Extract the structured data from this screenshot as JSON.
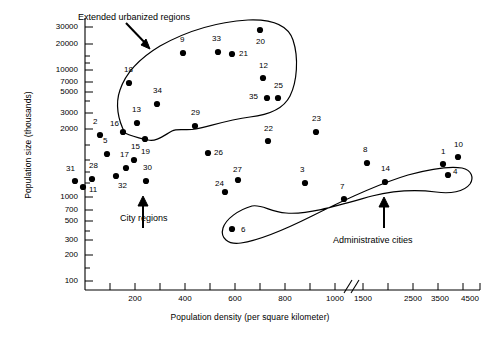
{
  "chart_data": {
    "type": "scatter",
    "title": "",
    "xlabel": "Population density (per square kilometer)",
    "ylabel": "Population size (thousands)",
    "yscale": "log",
    "grid": false,
    "legend": "none",
    "axis_break": "//",
    "xticks": [
      {
        "label": "",
        "value": 0,
        "px": 85
      },
      {
        "label": "",
        "value": 100,
        "px": 110
      },
      {
        "label": "200",
        "value": 200,
        "px": 135
      },
      {
        "label": "",
        "value": 300,
        "px": 160
      },
      {
        "label": "400",
        "value": 400,
        "px": 185
      },
      {
        "label": "",
        "value": 500,
        "px": 210
      },
      {
        "label": "600",
        "value": 600,
        "px": 235
      },
      {
        "label": "",
        "value": 700,
        "px": 260
      },
      {
        "label": "800",
        "value": 800,
        "px": 285
      },
      {
        "label": "",
        "value": 900,
        "px": 310
      },
      {
        "label": "1000",
        "value": 1000,
        "px": 335
      },
      {
        "label": "1500",
        "value": 1500,
        "px": 363
      },
      {
        "label": "",
        "value": 2000,
        "px": 388
      },
      {
        "label": "2500",
        "value": 2500,
        "px": 413
      },
      {
        "label": "",
        "value": 3000,
        "px": 438
      },
      {
        "label": "3500",
        "value": 3500,
        "px": 440
      },
      {
        "label": "",
        "value": 4000,
        "px": 443
      },
      {
        "label": "4500",
        "value": 4500,
        "px": 470
      }
    ],
    "yticks": [
      {
        "label": "30000",
        "value": 30000,
        "px": 27
      },
      {
        "label": "20000",
        "value": 20000,
        "px": 44
      },
      {
        "label": "10000",
        "value": 10000,
        "px": 70
      },
      {
        "label": "7000",
        "value": 7000,
        "px": 82
      },
      {
        "label": "5000",
        "value": 5000,
        "px": 92
      },
      {
        "label": "3000",
        "value": 3000,
        "px": 113
      },
      {
        "label": "2000",
        "value": 2000,
        "px": 129
      },
      {
        "label": "1000",
        "value": 1000,
        "px": 197
      },
      {
        "label": "700",
        "value": 700,
        "px": 210
      },
      {
        "label": "500",
        "value": 500,
        "px": 221
      },
      {
        "label": "300",
        "value": 300,
        "px": 240
      },
      {
        "label": "200",
        "value": 200,
        "px": 255
      },
      {
        "label": "100",
        "value": 100,
        "px": 281
      }
    ],
    "xlim": [
      0,
      4500
    ],
    "ylim": [
      80,
      40000
    ],
    "points": [
      {
        "id": "31",
        "x": 100,
        "y": 1300,
        "px": 75,
        "py": 181,
        "lx": 66,
        "ly": 169
      },
      {
        "id": "11",
        "x": 118,
        "y": 1150,
        "px": 83,
        "py": 187,
        "lx": 89,
        "ly": 190
      },
      {
        "id": "28",
        "x": 162,
        "y": 1400,
        "px": 92,
        "py": 179,
        "lx": 89,
        "ly": 166
      },
      {
        "id": "2",
        "x": 168,
        "y": 3150,
        "px": 100,
        "py": 135,
        "lx": 93,
        "ly": 122
      },
      {
        "id": "5",
        "x": 180,
        "y": 2300,
        "px": 107,
        "py": 154,
        "lx": 103,
        "ly": 141
      },
      {
        "id": "32",
        "x": 215,
        "y": 1500,
        "px": 116,
        "py": 176,
        "lx": 118,
        "ly": 186
      },
      {
        "id": "16",
        "x": 235,
        "y": 3350,
        "px": 123,
        "py": 132,
        "lx": 110,
        "ly": 124
      },
      {
        "id": "17",
        "x": 248,
        "y": 1750,
        "px": 126,
        "py": 168,
        "lx": 120,
        "ly": 155
      },
      {
        "id": "15",
        "x": 272,
        "y": 1980,
        "px": 134,
        "py": 160,
        "lx": 131,
        "ly": 147
      },
      {
        "id": "18",
        "x": 258,
        "y": 7200,
        "px": 129,
        "py": 83,
        "lx": 124,
        "ly": 70
      },
      {
        "id": "13",
        "x": 278,
        "y": 3900,
        "px": 137,
        "py": 123,
        "lx": 132,
        "ly": 110
      },
      {
        "id": "30",
        "x": 322,
        "y": 1300,
        "px": 146,
        "py": 181,
        "lx": 143,
        "ly": 168
      },
      {
        "id": "19",
        "x": 318,
        "y": 2900,
        "px": 145,
        "py": 139,
        "lx": 141,
        "ly": 152
      },
      {
        "id": "34",
        "x": 368,
        "y": 5150,
        "px": 157,
        "py": 104,
        "lx": 153,
        "ly": 91
      },
      {
        "id": "9",
        "x": 508,
        "y": 17500,
        "px": 183,
        "py": 53,
        "lx": 180,
        "ly": 40
      },
      {
        "id": "29",
        "x": 578,
        "y": 3700,
        "px": 195,
        "py": 126,
        "lx": 191,
        "ly": 113
      },
      {
        "id": "26",
        "x": 648,
        "y": 2350,
        "px": 208,
        "py": 153,
        "lx": 214,
        "ly": 153
      },
      {
        "id": "33",
        "x": 672,
        "y": 18000,
        "px": 218,
        "py": 52,
        "lx": 212,
        "ly": 39
      },
      {
        "id": "21",
        "x": 742,
        "y": 17500,
        "px": 232,
        "py": 54,
        "lx": 239,
        "ly": 54
      },
      {
        "id": "24",
        "x": 700,
        "y": 830,
        "px": 225,
        "py": 192,
        "lx": 215,
        "ly": 184
      },
      {
        "id": "27",
        "x": 738,
        "y": 1150,
        "px": 238,
        "py": 180,
        "lx": 233,
        "ly": 170
      },
      {
        "id": "6",
        "x": 718,
        "y": 385,
        "px": 232,
        "py": 229,
        "lx": 241,
        "ly": 230
      },
      {
        "id": "20",
        "x": 830,
        "y": 22500,
        "px": 260,
        "py": 30,
        "lx": 256,
        "ly": 42
      },
      {
        "id": "12",
        "x": 840,
        "y": 8200,
        "px": 263,
        "py": 78,
        "lx": 259,
        "ly": 66
      },
      {
        "id": "35",
        "x": 855,
        "y": 5800,
        "px": 267,
        "py": 98,
        "lx": 249,
        "ly": 97
      },
      {
        "id": "25",
        "x": 888,
        "y": 5800,
        "px": 278,
        "py": 98,
        "lx": 274,
        "ly": 86
      },
      {
        "id": "22",
        "x": 862,
        "y": 2650,
        "px": 268,
        "py": 141,
        "lx": 264,
        "ly": 129
      },
      {
        "id": "23",
        "x": 1020,
        "y": 3000,
        "px": 316,
        "py": 132,
        "lx": 312,
        "ly": 119
      },
      {
        "id": "3",
        "x": 1480,
        "y": 1350,
        "px": 305,
        "py": 183,
        "lx": 300,
        "ly": 170
      },
      {
        "id": "7",
        "x": 1950,
        "y": 760,
        "px": 344,
        "py": 199,
        "lx": 340,
        "ly": 187
      },
      {
        "id": "8",
        "x": 2230,
        "y": 1850,
        "px": 367,
        "py": 163,
        "lx": 363,
        "ly": 150
      },
      {
        "id": "14",
        "x": 2600,
        "y": 1300,
        "px": 385,
        "py": 182,
        "lx": 381,
        "ly": 169
      },
      {
        "id": "1",
        "x": 3980,
        "y": 1700,
        "px": 443,
        "py": 164,
        "lx": 441,
        "ly": 152
      },
      {
        "id": "4",
        "x": 4050,
        "y": 1400,
        "px": 448,
        "py": 175,
        "lx": 453,
        "ly": 172
      },
      {
        "id": "10",
        "x": 4200,
        "y": 2050,
        "px": 458,
        "py": 157,
        "lx": 454,
        "ly": 145
      }
    ],
    "annotations": [
      {
        "name": "extended-urbanized-regions",
        "text": "Extended urbanized regions",
        "lx": 78,
        "ly": 12
      },
      {
        "name": "city-regions",
        "text": "City regions",
        "lx": 120,
        "ly": 213
      },
      {
        "name": "administrative-cities",
        "text": "Administrative cities",
        "lx": 333,
        "ly": 235
      }
    ],
    "groups": [
      {
        "name": "extended-urbanized-regions"
      },
      {
        "name": "administrative-cities"
      }
    ]
  }
}
